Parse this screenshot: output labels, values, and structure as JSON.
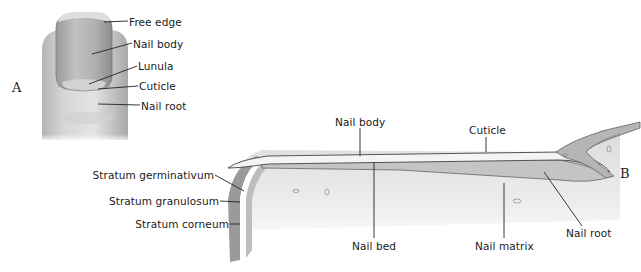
{
  "figure": {
    "panels": [
      {
        "id": "A",
        "letter": "A",
        "labels": {
          "free_edge": "Free edge",
          "nail_body": "Nail body",
          "lunula": "Lunula",
          "cuticle": "Cuticle",
          "nail_root": "Nail root"
        }
      },
      {
        "id": "B",
        "letter": "B",
        "labels": {
          "nail_body": "Nail body",
          "cuticle": "Cuticle",
          "stratum_germinativum": "Stratum germinativum",
          "stratum_granulosum": "Stratum granulosum",
          "stratum_corneum": "Stratum corneum",
          "nail_bed": "Nail bed",
          "nail_matrix": "Nail matrix",
          "nail_root": "Nail root"
        }
      }
    ]
  },
  "colors": {
    "skin_light": "#e6e6e6",
    "skin_mid": "#c8c8c8",
    "skin_dark": "#8c8c8c",
    "line": "#222222"
  }
}
